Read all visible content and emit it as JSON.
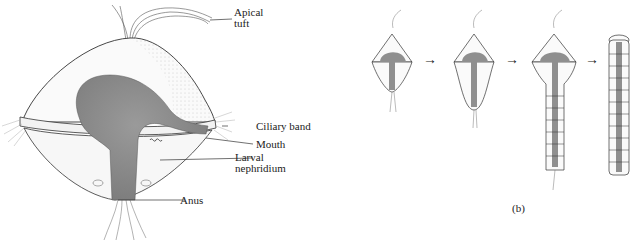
{
  "panel_a": {
    "labels": {
      "apical_tuft": [
        "Apical",
        "tuft"
      ],
      "ciliary_band": "Ciliary band",
      "mouth": "Mouth",
      "larval_nephridium": [
        "Larval",
        "nephridium"
      ],
      "anus": "Anus"
    }
  },
  "panel_b": {
    "caption": "(b)",
    "stages": 4,
    "arrow_glyph": "→"
  },
  "colors": {
    "gut": "#8f8f8f",
    "outline": "#333333",
    "background": "#ffffff"
  }
}
